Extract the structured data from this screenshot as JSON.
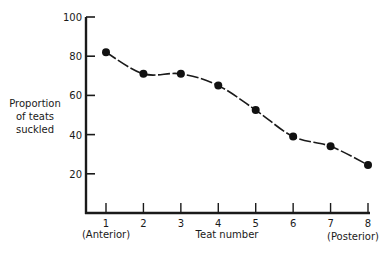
{
  "chart_data": {
    "type": "line",
    "title": "",
    "xlabel": "Teat number",
    "ylabel_lines": [
      "Proportion",
      "of teats",
      "suckled"
    ],
    "x": [
      1,
      2,
      3,
      4,
      5,
      6,
      7,
      8
    ],
    "x_tick_labels": [
      "1",
      "2",
      "3",
      "4",
      "5",
      "6",
      "7",
      "8"
    ],
    "x_end_annotations": {
      "left": "(Anterior)",
      "right": "(Posterior)"
    },
    "series": [
      {
        "name": "Proportion of teats suckled",
        "values": [
          82,
          71,
          71,
          65,
          52.5,
          39,
          34,
          24.5
        ]
      }
    ],
    "y_ticks": [
      20,
      40,
      60,
      80,
      100
    ],
    "y_tick_labels": [
      "20",
      "40",
      "60",
      "80",
      "100"
    ],
    "xlim": [
      0.5,
      8
    ],
    "ylim": [
      0,
      100
    ],
    "grid": false,
    "legend": "none",
    "line_style": "smooth",
    "colors": {
      "line": "#1a1a1a",
      "marker": "#111111",
      "axis": "#1a1a1a"
    }
  }
}
